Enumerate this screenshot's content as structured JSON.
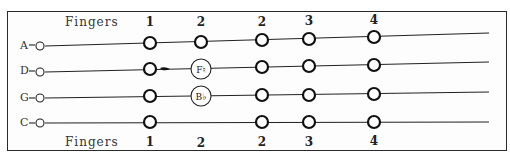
{
  "header": {
    "label": "Fingers",
    "fingers": [
      {
        "text": "1",
        "x": 150
      },
      {
        "text": "2",
        "x": 201
      },
      {
        "text": "2",
        "x": 262
      },
      {
        "text": "3",
        "x": 309
      },
      {
        "text": "4",
        "x": 374
      }
    ]
  },
  "footer": {
    "label": "Fingers",
    "fingers": [
      {
        "text": "1",
        "x": 150
      },
      {
        "text": "2",
        "x": 201
      },
      {
        "text": "2",
        "x": 262
      },
      {
        "text": "3",
        "x": 309
      },
      {
        "text": "4",
        "x": 374
      }
    ]
  },
  "strings": [
    {
      "name": "A",
      "y": 45,
      "notes": [
        {
          "x": 150
        },
        {
          "x": 201
        },
        {
          "x": 262
        },
        {
          "x": 309
        },
        {
          "x": 374
        }
      ]
    },
    {
      "name": "D",
      "y": 70,
      "notes": [
        {
          "x": 150
        },
        {
          "x": 201,
          "label": "F♮"
        },
        {
          "x": 262
        },
        {
          "x": 309
        },
        {
          "x": 374
        }
      ]
    },
    {
      "name": "G",
      "y": 97,
      "notes": [
        {
          "x": 150
        },
        {
          "x": 201,
          "label": "B♭"
        },
        {
          "x": 262
        },
        {
          "x": 309
        },
        {
          "x": 374
        }
      ]
    },
    {
      "name": "C",
      "y": 122,
      "notes": [
        {
          "x": 150
        },
        {
          "x": 262
        },
        {
          "x": 309
        },
        {
          "x": 374
        }
      ]
    }
  ]
}
